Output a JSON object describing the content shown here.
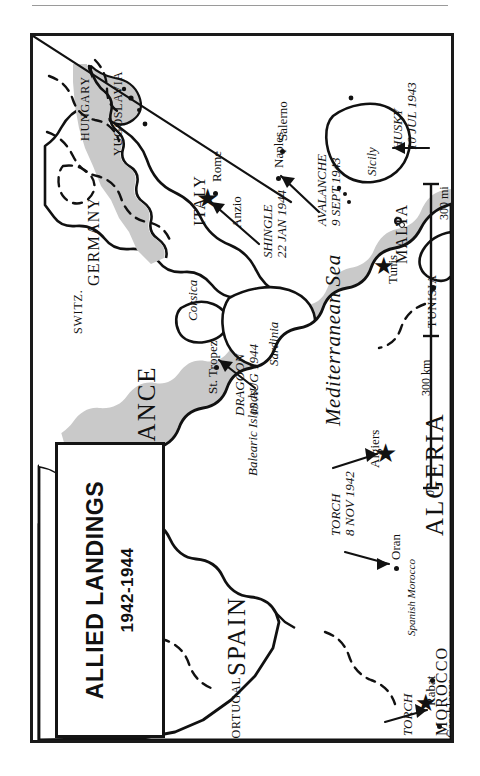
{
  "map": {
    "title": "ALLIED LANDINGS",
    "subtitle": "1942-1944",
    "orientation_note": "rotated",
    "colors": {
      "sea": "#c9c9c9",
      "land": "#ffffff",
      "ink": "#111111",
      "frame": "#1a1a1a"
    },
    "countries": [
      {
        "id": "germany",
        "label": "GERMANY"
      },
      {
        "id": "hungary",
        "label": "HUNGARY"
      },
      {
        "id": "yugoslavia",
        "label": "YUGOSLAVIA"
      },
      {
        "id": "switz",
        "label": "SWITZ."
      },
      {
        "id": "france",
        "label": "FRANCE"
      },
      {
        "id": "italy",
        "label": "ITALY"
      },
      {
        "id": "spain",
        "label": "SPAIN"
      },
      {
        "id": "portugal",
        "label": "PORTUGAL"
      },
      {
        "id": "algeria",
        "label": "ALGERIA"
      },
      {
        "id": "tunisia",
        "label": "TUNISIA"
      },
      {
        "id": "morocco",
        "label": "MOROCCO"
      },
      {
        "id": "malta",
        "label": "MALTA"
      }
    ],
    "regions": [
      {
        "id": "corsica",
        "label": "Corsica"
      },
      {
        "id": "sardinia",
        "label": "Sardinia"
      },
      {
        "id": "sicily",
        "label": "Sicily"
      },
      {
        "id": "balearic",
        "label": "Balearic Islands"
      },
      {
        "id": "sp-morocco",
        "label": "Spanish Morocco"
      },
      {
        "id": "med-sea",
        "label": "Mediterranean Sea"
      }
    ],
    "cities": [
      {
        "id": "rome",
        "label": "Rome"
      },
      {
        "id": "naples",
        "label": "Naples"
      },
      {
        "id": "salerno",
        "label": "Salerno"
      },
      {
        "id": "anzio",
        "label": "Anzio"
      },
      {
        "id": "st-tropez",
        "label": "St. Tropez"
      },
      {
        "id": "algiers",
        "label": "Algiers"
      },
      {
        "id": "oran",
        "label": "Oran"
      },
      {
        "id": "tunis",
        "label": "Tunis"
      },
      {
        "id": "rabat",
        "label": "Rabat"
      },
      {
        "id": "casablanca",
        "label": "Casablanca"
      }
    ],
    "operations": [
      {
        "id": "husky",
        "name": "HUSKY",
        "date": "10 JUL 1943",
        "target": "Sicily"
      },
      {
        "id": "avalanche",
        "name": "AVALANCHE",
        "date": "9 SEPT 1943",
        "target": "Salerno"
      },
      {
        "id": "shingle",
        "name": "SHINGLE",
        "date": "22 JAN 1944",
        "target": "Anzio"
      },
      {
        "id": "dragoon",
        "name": "DRAGOON",
        "date": "15 AUG 1944",
        "target": "St. Tropez"
      },
      {
        "id": "torch-alg",
        "name": "TORCH",
        "date": "8 NOV 1942",
        "target": "Algiers / Oran"
      },
      {
        "id": "torch-mor",
        "name": "TORCH",
        "date": "",
        "target": "Casablanca"
      }
    ],
    "scale": {
      "zero": "0",
      "km": "300 km",
      "mi": "300 mi"
    }
  }
}
